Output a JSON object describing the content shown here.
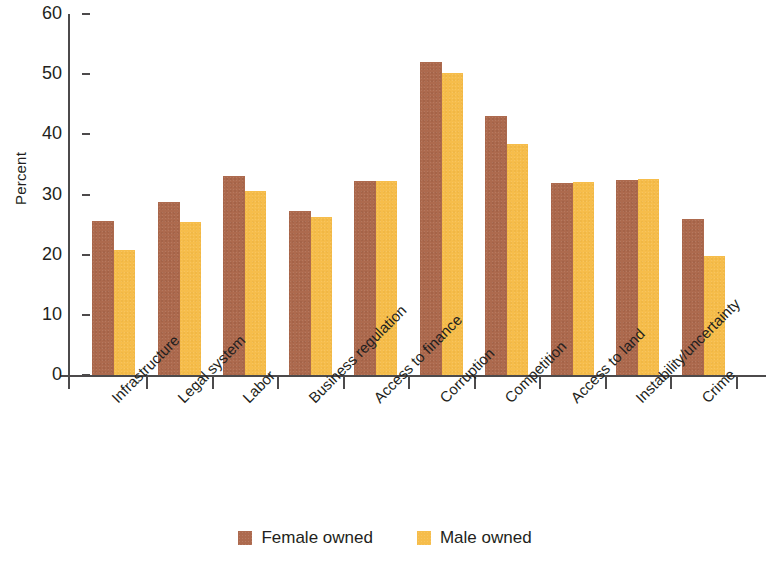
{
  "chart_data": {
    "type": "bar",
    "title": "",
    "xlabel": "",
    "ylabel": "Percent",
    "ylim": [
      0,
      60
    ],
    "yticks": [
      0,
      10,
      20,
      30,
      40,
      50,
      60
    ],
    "ytick_labels": [
      "0",
      "10",
      "20",
      "30",
      "40",
      "50",
      "60"
    ],
    "grid": false,
    "legend_position": "bottom-center",
    "categories": [
      "Infrastructure",
      "Legal system",
      "Labor",
      "Business regulation",
      "Access to finance",
      "Corruption",
      "Competition",
      "Access to land",
      "Instability/uncertainty",
      "Crime"
    ],
    "series": [
      {
        "name": "Female owned",
        "color": "#ad6a4e",
        "values": [
          25.6,
          28.7,
          33.0,
          27.2,
          32.2,
          52.0,
          43.0,
          31.9,
          32.4,
          25.9
        ]
      },
      {
        "name": "Male owned",
        "color": "#f6bd4b",
        "values": [
          20.7,
          25.4,
          30.6,
          26.2,
          32.3,
          50.2,
          38.4,
          32.1,
          32.5,
          19.8
        ]
      }
    ]
  },
  "legend": {
    "items": [
      {
        "label": "Female owned",
        "color": "#ad6a4e"
      },
      {
        "label": "Male owned",
        "color": "#f6bd4b"
      }
    ]
  }
}
